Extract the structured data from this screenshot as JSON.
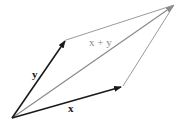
{
  "diagram": {
    "type": "vector-addition-parallelogram",
    "vectors": [
      {
        "id": "x",
        "label": "x",
        "style": "bold-arrow",
        "color": "#1a1a1a"
      },
      {
        "id": "y",
        "label": "y",
        "style": "bold-arrow",
        "color": "#1a1a1a"
      },
      {
        "id": "sum",
        "label": "x + y",
        "style": "arrow",
        "color": "#8a8a8a"
      }
    ],
    "edge_color": "#9a9a9a",
    "labels": {
      "x": "x",
      "y": "y",
      "sum": "x + y"
    }
  }
}
